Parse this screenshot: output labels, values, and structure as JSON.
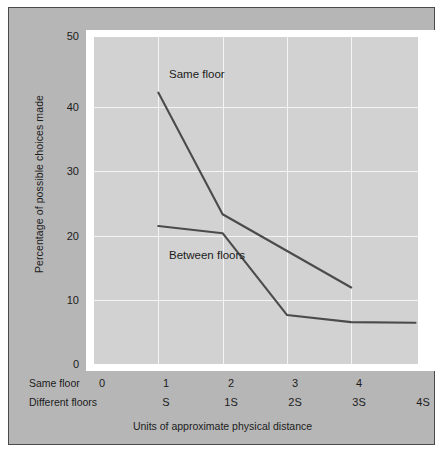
{
  "chart_data": {
    "type": "line",
    "title": "",
    "xlabel": "Units of approximate physical distance",
    "ylabel": "Percentage of possible choices made",
    "ylim": [
      0,
      50
    ],
    "yticks": [
      0,
      10,
      20,
      30,
      40,
      50
    ],
    "ytick_labels": [
      "0",
      "10",
      "20",
      "30",
      "40",
      "50"
    ],
    "grid": true,
    "legend_position": "inline-annotation",
    "x_axis_rows": [
      {
        "row_label": "Same floor",
        "ticks": [
          "0",
          "1",
          "2",
          "3",
          "4",
          ""
        ]
      },
      {
        "row_label": "Different floors",
        "ticks": [
          "",
          "S",
          "1S",
          "2S",
          "3S",
          "4S"
        ]
      }
    ],
    "x_positions": [
      0,
      1,
      2,
      3,
      4,
      5
    ],
    "series": [
      {
        "name": "Same floor",
        "x": [
          1,
          2,
          4
        ],
        "values": [
          41.5,
          22.9,
          11.7
        ]
      },
      {
        "name": "Between floors",
        "x": [
          1,
          2,
          3,
          4,
          5
        ],
        "values": [
          21.1,
          20.0,
          7.5,
          6.4,
          6.3
        ]
      }
    ],
    "annotations": [
      {
        "text": "Same floor",
        "series": "Same floor"
      },
      {
        "text": "Between floors",
        "series": "Between floors"
      }
    ],
    "colors": {
      "figure_background": "#b6b6b6",
      "plot_background": "#d2d2d2",
      "mat": "#ffffff",
      "gridline": "#f4f4f4",
      "series_line": "#4b4b4b",
      "text": "#1c1c1c",
      "border": "#4a4a4a"
    }
  }
}
